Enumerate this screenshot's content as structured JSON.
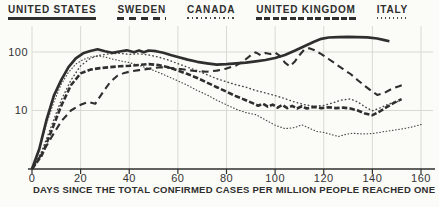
{
  "colors": {
    "ink": "#2f2f2f",
    "dotted_ink": "#474747",
    "grid": "#dadad4",
    "paper": "#fbfbf8"
  },
  "chart_data": {
    "type": "line",
    "title": "",
    "xlabel": "DAYS SINCE THE TOTAL CONFIRMED CASES PER MILLION PEOPLE REACHED ONE",
    "ylabel": "",
    "y_scale": "log",
    "xlim": [
      0,
      165
    ],
    "ylim": [
      1,
      220
    ],
    "grid": true,
    "legend_position": "top",
    "x_ticks": [
      0,
      20,
      40,
      60,
      80,
      100,
      120,
      140,
      160
    ],
    "y_ticks": [
      {
        "value": 100,
        "label": "100"
      },
      {
        "value": 10,
        "label": "10"
      }
    ],
    "series": [
      {
        "name": "UNITED STATES",
        "style": "solid-thick",
        "points": [
          [
            0,
            1
          ],
          [
            3,
            2.2
          ],
          [
            6,
            7
          ],
          [
            9,
            18
          ],
          [
            12,
            33
          ],
          [
            15,
            55
          ],
          [
            18,
            78
          ],
          [
            21,
            95
          ],
          [
            24,
            104
          ],
          [
            27,
            111
          ],
          [
            30,
            103
          ],
          [
            33,
            97
          ],
          [
            36,
            102
          ],
          [
            39,
            107
          ],
          [
            42,
            99
          ],
          [
            44,
            106
          ],
          [
            46,
            99
          ],
          [
            48,
            106
          ],
          [
            51,
            103
          ],
          [
            54,
            97
          ],
          [
            57,
            89
          ],
          [
            60,
            82
          ],
          [
            64,
            74
          ],
          [
            68,
            68
          ],
          [
            72,
            64
          ],
          [
            76,
            61
          ],
          [
            80,
            62
          ],
          [
            84,
            64
          ],
          [
            88,
            66
          ],
          [
            92,
            69
          ],
          [
            96,
            73
          ],
          [
            100,
            79
          ],
          [
            104,
            89
          ],
          [
            108,
            105
          ],
          [
            112,
            125
          ],
          [
            116,
            150
          ],
          [
            119,
            168
          ],
          [
            122,
            177
          ],
          [
            126,
            180
          ],
          [
            130,
            181
          ],
          [
            134,
            180
          ],
          [
            138,
            178
          ],
          [
            142,
            170
          ],
          [
            145,
            160
          ],
          [
            147,
            153
          ]
        ]
      },
      {
        "name": "SWEDEN",
        "style": "dashed",
        "points": [
          [
            0,
            1
          ],
          [
            4,
            1.8
          ],
          [
            8,
            3.5
          ],
          [
            12,
            6.5
          ],
          [
            16,
            10
          ],
          [
            20,
            12.5
          ],
          [
            23,
            14
          ],
          [
            26,
            13
          ],
          [
            29,
            20
          ],
          [
            32,
            30
          ],
          [
            35,
            39
          ],
          [
            38,
            44
          ],
          [
            41,
            47
          ],
          [
            44,
            49
          ],
          [
            47,
            51
          ],
          [
            50,
            53
          ],
          [
            53,
            55
          ],
          [
            56,
            54
          ],
          [
            60,
            52
          ],
          [
            64,
            49
          ],
          [
            68,
            47
          ],
          [
            72,
            46
          ],
          [
            76,
            48
          ],
          [
            80,
            52
          ],
          [
            84,
            59
          ],
          [
            87,
            70
          ],
          [
            90,
            88
          ],
          [
            92,
            99
          ],
          [
            94,
            88
          ],
          [
            96,
            96
          ],
          [
            98,
            92
          ],
          [
            100,
            98
          ],
          [
            102,
            86
          ],
          [
            104,
            66
          ],
          [
            106,
            57
          ],
          [
            108,
            68
          ],
          [
            110,
            88
          ],
          [
            112,
            110
          ],
          [
            114,
            116
          ],
          [
            116,
            108
          ],
          [
            119,
            92
          ],
          [
            122,
            76
          ],
          [
            125,
            62
          ],
          [
            128,
            51
          ],
          [
            131,
            42
          ],
          [
            134,
            33
          ],
          [
            137,
            26
          ],
          [
            140,
            21
          ],
          [
            142,
            18.5
          ],
          [
            145,
            20
          ],
          [
            148,
            23.5
          ],
          [
            151,
            26
          ],
          [
            153,
            28
          ]
        ]
      },
      {
        "name": "CANADA",
        "style": "dotted",
        "points": [
          [
            0,
            1
          ],
          [
            4,
            2
          ],
          [
            8,
            5.5
          ],
          [
            12,
            15
          ],
          [
            16,
            33
          ],
          [
            20,
            58
          ],
          [
            24,
            78
          ],
          [
            28,
            88
          ],
          [
            32,
            93
          ],
          [
            36,
            95
          ],
          [
            40,
            91
          ],
          [
            44,
            93
          ],
          [
            48,
            89
          ],
          [
            52,
            82
          ],
          [
            56,
            73
          ],
          [
            60,
            63
          ],
          [
            64,
            55
          ],
          [
            68,
            48
          ],
          [
            72,
            41
          ],
          [
            76,
            35
          ],
          [
            80,
            31
          ],
          [
            84,
            27.5
          ],
          [
            88,
            25
          ],
          [
            92,
            22
          ],
          [
            96,
            20
          ],
          [
            100,
            18
          ],
          [
            104,
            16
          ],
          [
            108,
            14
          ],
          [
            112,
            12.6
          ],
          [
            116,
            11.8
          ],
          [
            120,
            12.2
          ],
          [
            124,
            13.6
          ],
          [
            127,
            15
          ],
          [
            131,
            15.8
          ],
          [
            134,
            14
          ],
          [
            137,
            11.5
          ],
          [
            140,
            9.9
          ],
          [
            143,
            11
          ],
          [
            146,
            12.5
          ],
          [
            149,
            13.8
          ],
          [
            151,
            14.5
          ]
        ]
      },
      {
        "name": "UNITED KINGDOM",
        "style": "dense-dashed-thick",
        "points": [
          [
            0,
            1
          ],
          [
            4,
            1.7
          ],
          [
            8,
            4.5
          ],
          [
            12,
            12
          ],
          [
            16,
            27
          ],
          [
            20,
            43
          ],
          [
            24,
            50
          ],
          [
            28,
            53
          ],
          [
            32,
            55
          ],
          [
            36,
            57
          ],
          [
            40,
            58
          ],
          [
            44,
            60
          ],
          [
            48,
            62
          ],
          [
            52,
            60
          ],
          [
            56,
            55
          ],
          [
            60,
            48
          ],
          [
            64,
            42
          ],
          [
            68,
            36
          ],
          [
            72,
            30
          ],
          [
            76,
            25
          ],
          [
            80,
            21
          ],
          [
            84,
            17.5
          ],
          [
            88,
            15
          ],
          [
            91,
            13.2
          ],
          [
            93,
            12.1
          ],
          [
            95,
            13
          ],
          [
            97,
            11.6
          ],
          [
            99,
            12.6
          ],
          [
            101,
            11.2
          ],
          [
            103,
            12.4
          ],
          [
            105,
            11
          ],
          [
            107,
            12
          ],
          [
            109,
            10.8
          ],
          [
            111,
            11.8
          ],
          [
            113,
            10.8
          ],
          [
            116,
            11.5
          ],
          [
            119,
            11
          ],
          [
            122,
            11.4
          ],
          [
            125,
            11
          ],
          [
            128,
            11.2
          ],
          [
            131,
            10.8
          ],
          [
            134,
            10
          ],
          [
            137,
            8.9
          ],
          [
            140,
            8.3
          ],
          [
            143,
            9.6
          ],
          [
            146,
            11.5
          ],
          [
            149,
            13.6
          ],
          [
            152,
            15.6
          ]
        ]
      },
      {
        "name": "ITALY",
        "style": "fine-dotted",
        "points": [
          [
            0,
            1
          ],
          [
            3,
            2.2
          ],
          [
            6,
            6
          ],
          [
            9,
            14
          ],
          [
            12,
            28
          ],
          [
            15,
            45
          ],
          [
            18,
            62
          ],
          [
            21,
            74
          ],
          [
            24,
            82
          ],
          [
            27,
            86
          ],
          [
            30,
            82
          ],
          [
            33,
            76
          ],
          [
            36,
            71
          ],
          [
            40,
            66
          ],
          [
            44,
            59
          ],
          [
            48,
            52
          ],
          [
            52,
            45
          ],
          [
            56,
            38
          ],
          [
            60,
            32
          ],
          [
            64,
            27
          ],
          [
            68,
            22
          ],
          [
            72,
            18.5
          ],
          [
            76,
            15
          ],
          [
            80,
            12.5
          ],
          [
            84,
            10.5
          ],
          [
            88,
            9.2
          ],
          [
            92,
            8.5
          ],
          [
            96,
            6.9
          ],
          [
            100,
            5.6
          ],
          [
            104,
            4.9
          ],
          [
            108,
            5.1
          ],
          [
            111,
            5.7
          ],
          [
            114,
            5
          ],
          [
            117,
            4.4
          ],
          [
            120,
            4.2
          ],
          [
            123,
            3.9
          ],
          [
            126,
            3.6
          ],
          [
            129,
            3.9
          ],
          [
            132,
            4.1
          ],
          [
            135,
            4
          ],
          [
            138,
            4
          ],
          [
            141,
            4.1
          ],
          [
            144,
            4.3
          ],
          [
            147,
            4.5
          ],
          [
            150,
            4.7
          ],
          [
            153,
            4.9
          ],
          [
            156,
            5.2
          ],
          [
            159,
            5.6
          ],
          [
            161,
            5.9
          ]
        ]
      }
    ]
  }
}
